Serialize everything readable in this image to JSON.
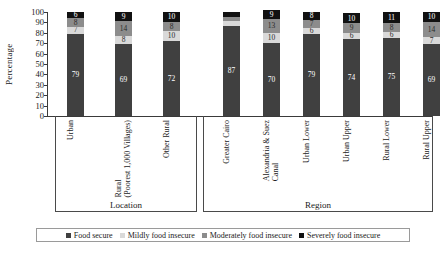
{
  "chart_data": {
    "type": "bar",
    "subtype": "stacked-column-100",
    "title": "",
    "xlabel": "",
    "ylabel": "Percentage",
    "ylim": [
      0,
      100
    ],
    "yticks": [
      0,
      10,
      20,
      30,
      40,
      50,
      60,
      70,
      80,
      90,
      100
    ],
    "grid": false,
    "legend_position": "bottom",
    "categories": [
      "Urban",
      "Rural (Poorest 1,000 Villages)",
      "Other Rural",
      "Greater Cairo",
      "Alexandria & Suez Canal",
      "Urban Lower",
      "Urban Upper",
      "Rural Lower",
      "Rural Upper"
    ],
    "groups": [
      {
        "label": "Location",
        "categories": [
          "Urban",
          "Rural (Poorest 1,000 Villages)",
          "Other Rural"
        ]
      },
      {
        "label": "Region",
        "categories": [
          "Greater Cairo",
          "Alexandria & Suez Canal",
          "Urban Lower",
          "Urban Upper",
          "Rural Lower",
          "Rural Upper"
        ]
      }
    ],
    "series": [
      {
        "name": "Food secure",
        "color": "#404040",
        "values": [
          79,
          69,
          72,
          87,
          70,
          79,
          74,
          75,
          69
        ]
      },
      {
        "name": "Mildly food insecure",
        "color": "#d9d9d9",
        "values": [
          7,
          8,
          10,
          4,
          10,
          6,
          6,
          6,
          7
        ]
      },
      {
        "name": "Moderately food insecure",
        "color": "#8c8c8c",
        "values": [
          8,
          14,
          8,
          4,
          13,
          7,
          9,
          8,
          14
        ]
      },
      {
        "name": "Severely food insecure",
        "color": "#111111",
        "values": [
          6,
          9,
          10,
          5,
          9,
          8,
          10,
          11,
          10
        ]
      }
    ]
  },
  "legend": {
    "items": [
      {
        "label": "Food secure",
        "color": "#404040"
      },
      {
        "label": "Mildly food insecure",
        "color": "#d9d9d9"
      },
      {
        "label": "Moderately food insecure",
        "color": "#8c8c8c"
      },
      {
        "label": "Severely food insecure",
        "color": "#111111"
      }
    ]
  },
  "axis": {
    "y_title": "Percentage"
  }
}
